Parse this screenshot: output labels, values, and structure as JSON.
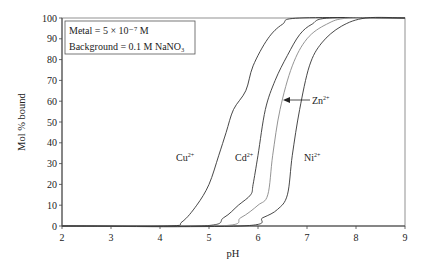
{
  "chart_data": {
    "type": "line",
    "title": "",
    "xlabel": "pH",
    "ylabel": "Mol % bound",
    "xlim": [
      2,
      9
    ],
    "ylim": [
      0,
      100
    ],
    "x_ticks": [
      2,
      3,
      4,
      5,
      6,
      7,
      8,
      9
    ],
    "y_ticks": [
      0,
      10,
      20,
      30,
      40,
      50,
      60,
      70,
      80,
      90,
      100
    ],
    "grid": false,
    "legend": {
      "position": "top-left",
      "lines": [
        "Metal = 5 × 10⁻⁷ M",
        "Background = 0.1 M NaNO₃"
      ]
    },
    "series": [
      {
        "name": "Cu2+",
        "label": "Cu",
        "sup": "2+",
        "color": "#333333",
        "points": [
          [
            2,
            0
          ],
          [
            4.15,
            0
          ],
          [
            4.45,
            2
          ],
          [
            4.75,
            10
          ],
          [
            5.0,
            20
          ],
          [
            5.2,
            34
          ],
          [
            5.35,
            45
          ],
          [
            5.5,
            56
          ],
          [
            5.75,
            65
          ],
          [
            5.9,
            77
          ],
          [
            6.2,
            90
          ],
          [
            6.5,
            97
          ],
          [
            6.85,
            100
          ],
          [
            9,
            100
          ]
        ]
      },
      {
        "name": "Cd2+",
        "label": "Cd",
        "sup": "2+",
        "color": "#333333",
        "points": [
          [
            2,
            0
          ],
          [
            4.85,
            0
          ],
          [
            5.3,
            4
          ],
          [
            5.6,
            10
          ],
          [
            5.85,
            15
          ],
          [
            5.9,
            20
          ],
          [
            6.0,
            34
          ],
          [
            6.15,
            56
          ],
          [
            6.35,
            70
          ],
          [
            6.6,
            82
          ],
          [
            6.85,
            92
          ],
          [
            7.1,
            97
          ],
          [
            7.45,
            100
          ],
          [
            9,
            100
          ]
        ]
      },
      {
        "name": "Zn2+",
        "label": "Zn",
        "sup": "2+",
        "color": "#888888",
        "points": [
          [
            2,
            0
          ],
          [
            5.2,
            0
          ],
          [
            5.65,
            4
          ],
          [
            6.0,
            10
          ],
          [
            6.2,
            15
          ],
          [
            6.3,
            34
          ],
          [
            6.45,
            56
          ],
          [
            6.7,
            77
          ],
          [
            7.0,
            90
          ],
          [
            7.4,
            97
          ],
          [
            7.85,
            100
          ],
          [
            9,
            100
          ]
        ]
      },
      {
        "name": "Ni2+",
        "label": "Ni",
        "sup": "2+",
        "color": "#333333",
        "points": [
          [
            2,
            0
          ],
          [
            5.65,
            0
          ],
          [
            6.1,
            4
          ],
          [
            6.4,
            8
          ],
          [
            6.6,
            15
          ],
          [
            6.7,
            34
          ],
          [
            6.85,
            56
          ],
          [
            7.05,
            77
          ],
          [
            7.3,
            88
          ],
          [
            7.7,
            96
          ],
          [
            8.2,
            100
          ],
          [
            9,
            100
          ]
        ]
      }
    ],
    "annotations": [
      {
        "text": "Cu",
        "sup": "2+",
        "x_px": 176,
        "y_px": 161
      },
      {
        "text": "Cd",
        "sup": "2+",
        "x_px": 235,
        "y_px": 161
      },
      {
        "text": "Zn",
        "sup": "2+",
        "x_px": 312,
        "y_px": 104,
        "arrow_to_px": [
          283,
          100
        ]
      },
      {
        "text": "Ni",
        "sup": "2+",
        "x_px": 304,
        "y_px": 161
      }
    ]
  }
}
